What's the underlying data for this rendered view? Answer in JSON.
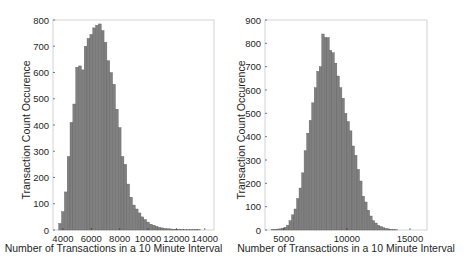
{
  "chart_data": [
    {
      "type": "bar",
      "subtype": "histogram",
      "title": "",
      "xlabel": "Number of Transactions in a 10 Minute Interval",
      "ylabel": "Transaction Count Occurence",
      "xlim": [
        3300,
        14650
      ],
      "ylim": [
        0,
        800
      ],
      "xticks": [
        4000,
        6000,
        8000,
        10000,
        12000,
        14000
      ],
      "yticks": [
        0,
        100,
        200,
        300,
        400,
        500,
        600,
        700,
        800
      ],
      "grid": false,
      "bin_start": 3700,
      "bin_width": 200,
      "values": [
        25,
        70,
        145,
        280,
        410,
        480,
        620,
        625,
        610,
        700,
        730,
        745,
        770,
        780,
        785,
        760,
        715,
        645,
        600,
        555,
        460,
        390,
        280,
        250,
        175,
        125,
        95,
        80,
        65,
        50,
        40,
        30,
        22,
        18,
        14,
        10,
        8,
        6,
        5,
        4,
        3,
        3,
        2,
        2,
        1,
        1,
        1,
        1,
        2,
        1
      ],
      "bar_color": "#808080"
    },
    {
      "type": "bar",
      "subtype": "histogram",
      "title": "",
      "xlabel": "Number of Transactions in a 10 Minute Interval",
      "ylabel": "Transaction Count Occurence",
      "xlim": [
        3500,
        16350
      ],
      "ylim": [
        0,
        900
      ],
      "xticks": [
        5000,
        10000,
        15000
      ],
      "yticks": [
        0,
        100,
        200,
        300,
        400,
        500,
        600,
        700,
        800,
        900
      ],
      "grid": false,
      "bin_start": 4000,
      "bin_width": 200,
      "values": [
        2,
        3,
        4,
        5,
        8,
        12,
        20,
        40,
        65,
        90,
        135,
        180,
        245,
        340,
        415,
        470,
        545,
        610,
        680,
        700,
        840,
        825,
        825,
        770,
        760,
        715,
        660,
        610,
        565,
        500,
        465,
        425,
        360,
        320,
        260,
        210,
        145,
        120,
        85,
        60,
        40,
        30,
        20,
        15,
        10,
        7,
        5,
        3,
        2,
        1
      ],
      "bar_color": "#808080"
    }
  ]
}
